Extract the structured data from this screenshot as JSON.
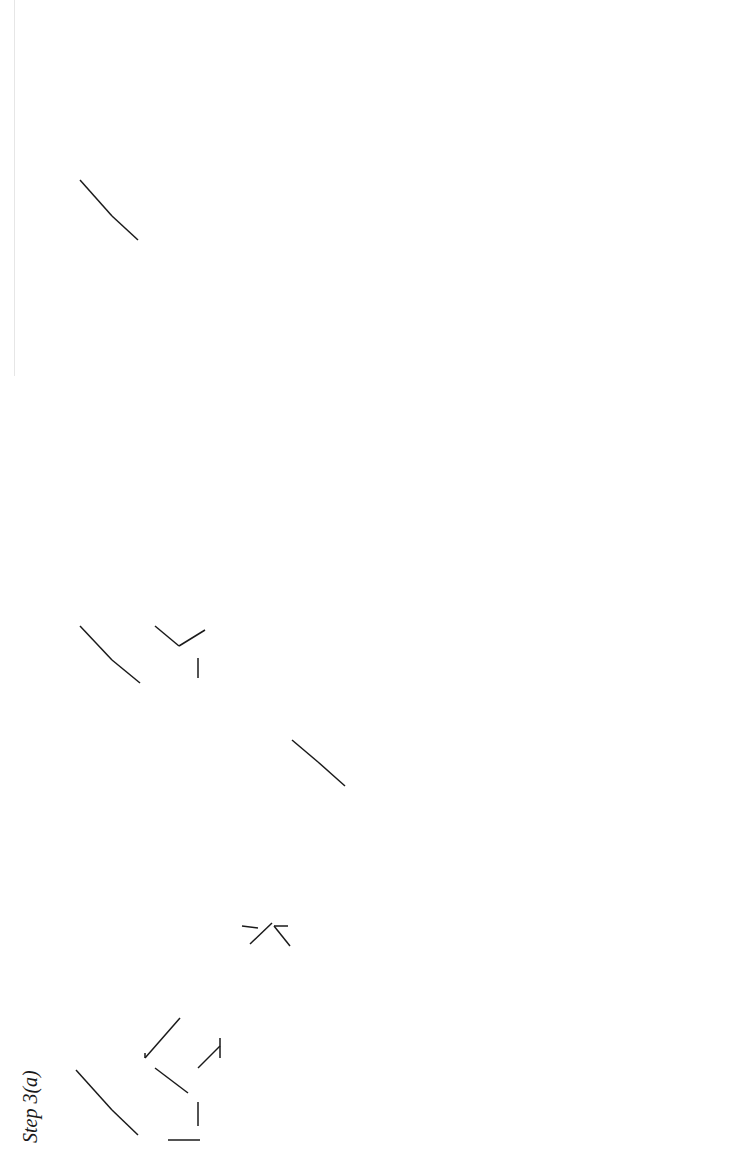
{
  "page": {
    "orientation": "rotated-90-ccw",
    "header_text": ""
  },
  "diagrams": [
    {
      "id": "step-3a",
      "label": "Step 3(a)",
      "nodes": {
        "root": {
          "cat": "C",
          "bars": 2
        },
        "cspec": "C-spec",
        "nbar2": {
          "cat": "N",
          "bars": 2
        },
        "que": "qué",
        "cbar": {
          "cat": "C",
          "bars": 1
        },
        "c": "C",
        "e": "e",
        "ccomp": "C-comp",
        "ibar2": {
          "cat": "I",
          "bars": 2
        },
        "ibar2b": {
          "cat": "I",
          "bars": 2
        },
        "v": "V",
        "ver": "ver"
      },
      "dashed_arrows": 2
    },
    {
      "id": "step-3c",
      "label": "3(c)",
      "nodes": {
        "root": {
          "cat": "C",
          "bars": 2
        },
        "cspec": "C-spec",
        "nbar2": {
          "cat": "N",
          "bars": 2
        },
        "que": "qué",
        "cbar": {
          "cat": "C",
          "bars": 1
        },
        "c": "C",
        "ce": "e",
        "ccomp": "C-comp",
        "ibar2": {
          "cat": "I",
          "bars": 2
        },
        "ispec": "I-spec",
        "nbar2b": {
          "cat": "N",
          "bars": 2
        },
        "trace": "trace",
        "ibar1": {
          "cat": "I",
          "bars": 1
        },
        "i": "I",
        "ie": "e",
        "icomp": "I-comp",
        "vbar2": {
          "cat": "V",
          "bars": 2
        },
        "vbar1": {
          "cat": "V",
          "bars": 1
        },
        "v": "V",
        "ver": "ver",
        "vcomp": "V-comp",
        "nbar2c": {
          "cat": "N",
          "bars": 2
        }
      },
      "movement_arrow": {
        "from": "trace",
        "to": "qué"
      },
      "dashed_arrows": 1
    },
    {
      "id": "step-3d",
      "label": "3(d)",
      "nodes": {
        "root": {
          "cat": "C",
          "bars": 2
        },
        "cspec": "C-spec",
        "nbar2": {
          "cat": "N",
          "bars": 2
        },
        "que": "qué",
        "cbar": {
          "cat": "C",
          "bars": 1
        },
        "c": "C",
        "ce": "e",
        "ccomp": "C-comp",
        "ibar2": {
          "cat": "I",
          "bars": 2
        },
        "ispec": "I-spec",
        "nbar2b": {
          "cat": "N",
          "bars": 2
        },
        "pro": "pro",
        "ibar1": {
          "cat": "I",
          "bars": 1
        },
        "i": "I",
        "ie": "e",
        "icomp": "I-comp",
        "vbar2": {
          "cat": "V",
          "bars": 2
        },
        "vbar1": {
          "cat": "V",
          "bars": 1
        },
        "v": "V",
        "ver": "ver",
        "vcomp": "V-comp",
        "nbar2c": {
          "cat": "N",
          "bars": 2
        }
      },
      "dashed_arrows": 1
    }
  ],
  "colors": {
    "ink": "#1a1a1a",
    "dashed": "#333333",
    "rule": "#e6e6e6"
  }
}
